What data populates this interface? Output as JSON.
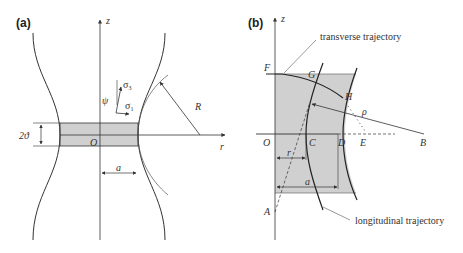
{
  "figure": {
    "panel_a": {
      "label": "(a)",
      "axis_z": "z",
      "axis_r": "r",
      "origin": "O",
      "neck_radius": "a",
      "curvature_radius": "R",
      "thickness": "2ϑ",
      "sigma_3": "σ",
      "sigma_3_sub": "3",
      "sigma_1": "σ",
      "sigma_1_sub": "1",
      "psi": "ψ"
    },
    "panel_b": {
      "label": "(b)",
      "axis_z": "z",
      "points": {
        "O": "O",
        "C": "C",
        "D": "D",
        "E": "E",
        "B": "B",
        "F": "F",
        "G": "G",
        "H": "H",
        "A": "A"
      },
      "rho": "ρ",
      "r": "r",
      "a": "a",
      "transverse": "transverse trajectory",
      "longitudinal": "longitudinal trajectory"
    },
    "colors": {
      "line": "#333333",
      "shade": "#d0d0d0"
    }
  }
}
